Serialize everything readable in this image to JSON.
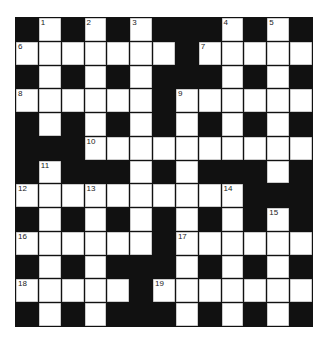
{
  "puzzle": {
    "rows": 13,
    "cols": 13,
    "colors": {
      "block": "#111111",
      "cell": "#ffffff",
      "grid_line": "#9a9a9a"
    },
    "layout": [
      "#.#.#.###.#.#",
      ".......#.....",
      "#.#.#.###.#.#",
      "......#......",
      "#.#.#.#.#.#.#",
      "###..........",
      "#.###.#.###.#",
      "..........###",
      "#.#.#.#.#.#.#",
      "......#......",
      "#.#.###.#.#.#",
      ".....#.......",
      "#.#.###.#.#.#"
    ],
    "numbers": [
      {
        "row": 0,
        "col": 1,
        "n": "1"
      },
      {
        "row": 0,
        "col": 3,
        "n": "2"
      },
      {
        "row": 0,
        "col": 5,
        "n": "3"
      },
      {
        "row": 0,
        "col": 9,
        "n": "4"
      },
      {
        "row": 0,
        "col": 11,
        "n": "5"
      },
      {
        "row": 1,
        "col": 0,
        "n": "6"
      },
      {
        "row": 1,
        "col": 8,
        "n": "7"
      },
      {
        "row": 3,
        "col": 0,
        "n": "8"
      },
      {
        "row": 3,
        "col": 7,
        "n": "9"
      },
      {
        "row": 5,
        "col": 3,
        "n": "10"
      },
      {
        "row": 6,
        "col": 1,
        "n": "11"
      },
      {
        "row": 7,
        "col": 0,
        "n": "12"
      },
      {
        "row": 7,
        "col": 3,
        "n": "13"
      },
      {
        "row": 7,
        "col": 9,
        "n": "14"
      },
      {
        "row": 8,
        "col": 11,
        "n": "15"
      },
      {
        "row": 9,
        "col": 0,
        "n": "16"
      },
      {
        "row": 9,
        "col": 7,
        "n": "17"
      },
      {
        "row": 11,
        "col": 0,
        "n": "18"
      },
      {
        "row": 11,
        "col": 6,
        "n": "19"
      }
    ]
  }
}
